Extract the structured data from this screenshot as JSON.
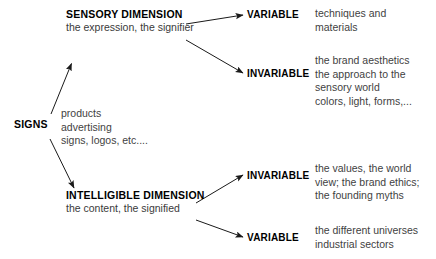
{
  "diagram": {
    "root": {
      "label": "SIGNS",
      "examples": "products\nadvertising\nsigns, logos, etc...."
    },
    "branches": [
      {
        "heading": "SENSORY DIMENSION",
        "subheading": "the expression, the signifier",
        "leaves": [
          {
            "term": "VARIABLE",
            "description": "techniques and\nmaterials"
          },
          {
            "term": "INVARIABLE",
            "description": "the brand aesthetics\nthe approach to the\nsensory world\ncolors, light, forms,..."
          }
        ]
      },
      {
        "heading": "INTELLIGIBLE DIMENSION",
        "subheading": "the content, the signified",
        "leaves": [
          {
            "term": "INVARIABLE",
            "description": "the values, the world\nview; the brand ethics;\nthe founding myths"
          },
          {
            "term": "VARIABLE",
            "description": "the different universes\nindustrial sectors"
          }
        ]
      }
    ],
    "colors": {
      "background": "#ffffff",
      "heading_text": "#000000",
      "body_text": "#3f3f3f",
      "arrow": "#1a1a1a"
    }
  }
}
